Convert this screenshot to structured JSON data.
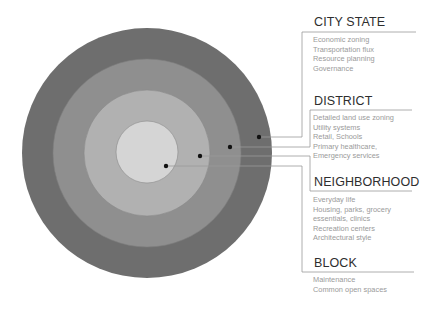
{
  "colors": {
    "ring_outer": "#6e6e6e",
    "ring_2": "#8f8f8f",
    "ring_3": "#b1b1b1",
    "ring_inner": "#d5d5d5",
    "ring_stroke": "#808080",
    "leader_line": "#9a9a9a",
    "dot": "#111111",
    "title_text": "#2e2e2e",
    "body_text": "#9a9a9a"
  },
  "scales": [
    {
      "id": "city-state",
      "title": "CITY STATE",
      "items": [
        "Economic zoning",
        "Transportation flux",
        "Resource planning",
        "Governance"
      ]
    },
    {
      "id": "district",
      "title": "DISTRICT",
      "items": [
        "Detailed land use zoning",
        "Utility systems",
        "Retail, Schools",
        "Primary healthcare,",
        "Emergency services"
      ]
    },
    {
      "id": "neighborhood",
      "title": "NEIGHBORHOOD",
      "items": [
        "Everyday life",
        "Housing, parks, grocery",
        "essentials, clinics",
        "Recreation centers",
        "Architectural style"
      ]
    },
    {
      "id": "block",
      "title": "BLOCK",
      "items": [
        "Maintenance",
        "Common open spaces"
      ]
    }
  ]
}
